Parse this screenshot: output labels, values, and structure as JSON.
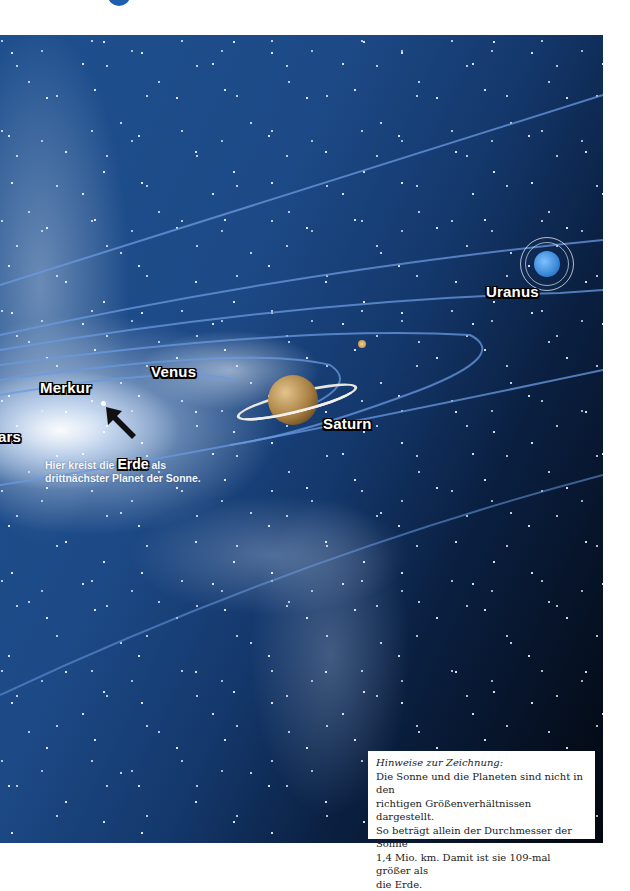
{
  "title_fragment": "g",
  "illustration": {
    "planets": [
      {
        "name": "Merkur",
        "label": "Merkur"
      },
      {
        "name": "Venus",
        "label": "Venus"
      },
      {
        "name": "Mars",
        "label": "ars"
      },
      {
        "name": "Saturn",
        "label": "Saturn"
      },
      {
        "name": "Uranus",
        "label": "Uranus"
      }
    ],
    "earth_note": {
      "prefix": "Hier kreist die",
      "highlight": "Erde",
      "suffix": "als drittnächster Planet der Sonne."
    }
  },
  "info_box": {
    "title": "Hinweise zur Zeichnung:",
    "lines": [
      "Die Sonne und die Planeten sind nicht in den",
      "richtigen Größenverhältnissen dargestellt.",
      "So beträgt allein der Durchmesser der Sonne",
      "1,4 Mio. km. Damit ist sie 109-mal größer als",
      "die Erde."
    ]
  },
  "colors": {
    "space_blue": "#1d4a87",
    "space_dark": "#03070f",
    "orbit": "#5d8fd6",
    "title_blue": "#1f5fb0"
  }
}
